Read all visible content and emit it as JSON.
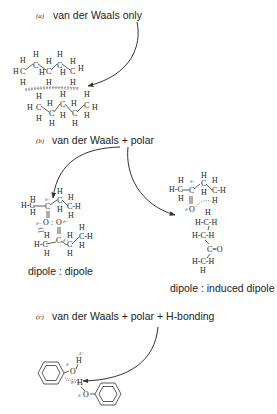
{
  "sections": [
    {
      "id": "a",
      "tag": "(a)",
      "title": "van der Waals only",
      "molecule": "pentane pair (CH3-CH2-CH2-CH2-CH3)",
      "caption": ""
    },
    {
      "id": "b",
      "tag": "(b)",
      "title": "van der Waals + polar",
      "left_caption": "dipole : dipole",
      "right_caption": "dipole : induced dipole"
    },
    {
      "id": "c",
      "tag": "(c)",
      "title": "van der Waals + polar + H-bonding",
      "molecule": "phenol pair"
    }
  ],
  "atoms": {
    "H": "H",
    "C": "C",
    "O": "O",
    "delta_plus": "δ+",
    "delta_minus": "δ−",
    "delta": "δ",
    "double_bond_O": "=O",
    "HC": "H-C",
    "CH": "C-H"
  },
  "colors": {
    "ink": "#222222",
    "background": "#ffffff"
  }
}
